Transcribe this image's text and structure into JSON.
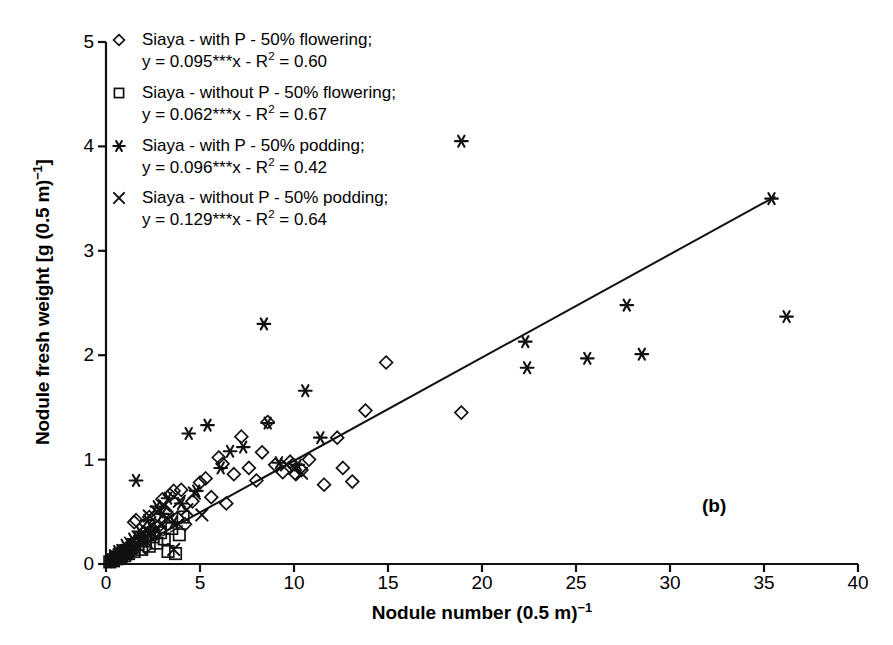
{
  "chart_data": {
    "type": "scatter",
    "title": "",
    "panel_label": "(b)",
    "xlabel": "Nodule number (0.5 m)⁻¹",
    "ylabel": "Nodule fresh weight [g (0.5 m)⁻¹]",
    "xlim": [
      0,
      40
    ],
    "ylim": [
      0,
      5
    ],
    "xticks": [
      0,
      5,
      10,
      15,
      20,
      25,
      30,
      35,
      40
    ],
    "yticks": [
      0,
      1,
      2,
      3,
      4,
      5
    ],
    "grid": false,
    "legend_position": "top-left",
    "series": [
      {
        "name": "Siaya - with P - 50% flowering;",
        "equation": "y = 0.095***x - R² = 0.60",
        "slope": 0.095,
        "r2": 0.6,
        "marker": "diamond",
        "color": "#000000",
        "trendline": "solid",
        "points": [
          [
            0.3,
            0.03
          ],
          [
            0.4,
            0.05
          ],
          [
            0.5,
            0.04
          ],
          [
            0.6,
            0.08
          ],
          [
            0.7,
            0.06
          ],
          [
            0.8,
            0.1
          ],
          [
            0.9,
            0.07
          ],
          [
            1.0,
            0.12
          ],
          [
            1.1,
            0.09
          ],
          [
            1.2,
            0.15
          ],
          [
            1.3,
            0.11
          ],
          [
            1.4,
            0.18
          ],
          [
            1.5,
            0.4
          ],
          [
            1.6,
            0.42
          ],
          [
            1.7,
            0.22
          ],
          [
            1.9,
            0.25
          ],
          [
            2.0,
            0.3
          ],
          [
            2.1,
            0.16
          ],
          [
            2.3,
            0.45
          ],
          [
            2.5,
            0.33
          ],
          [
            2.6,
            0.28
          ],
          [
            2.8,
            0.36
          ],
          [
            3.0,
            0.62
          ],
          [
            3.2,
            0.5
          ],
          [
            3.4,
            0.66
          ],
          [
            3.6,
            0.7
          ],
          [
            3.8,
            0.44
          ],
          [
            4.0,
            0.71
          ],
          [
            4.2,
            0.38
          ],
          [
            4.6,
            0.6
          ],
          [
            5.0,
            0.78
          ],
          [
            5.3,
            0.82
          ],
          [
            5.6,
            0.64
          ],
          [
            6.0,
            1.02
          ],
          [
            6.2,
            0.96
          ],
          [
            6.4,
            0.58
          ],
          [
            6.8,
            0.86
          ],
          [
            7.2,
            1.22
          ],
          [
            7.6,
            0.92
          ],
          [
            8.0,
            0.8
          ],
          [
            8.3,
            1.07
          ],
          [
            8.6,
            1.36
          ],
          [
            9.0,
            0.95
          ],
          [
            9.4,
            0.88
          ],
          [
            9.8,
            0.98
          ],
          [
            10.1,
            0.86
          ],
          [
            10.4,
            0.9
          ],
          [
            10.8,
            1.0
          ],
          [
            11.6,
            0.76
          ],
          [
            12.3,
            1.21
          ],
          [
            12.6,
            0.92
          ],
          [
            13.1,
            0.79
          ],
          [
            13.8,
            1.47
          ],
          [
            14.9,
            1.93
          ],
          [
            18.9,
            1.45
          ]
        ]
      },
      {
        "name": "Siaya - without P - 50% flowering;",
        "equation": "y = 0.062***x - R² = 0.67",
        "slope": 0.062,
        "r2": 0.67,
        "marker": "square",
        "color": "#000000",
        "trendline": "dashed",
        "points": [
          [
            0.2,
            0.02
          ],
          [
            0.3,
            0.04
          ],
          [
            0.4,
            0.03
          ],
          [
            0.5,
            0.06
          ],
          [
            0.6,
            0.05
          ],
          [
            0.7,
            0.09
          ],
          [
            0.8,
            0.07
          ],
          [
            0.9,
            0.11
          ],
          [
            1.0,
            0.08
          ],
          [
            1.1,
            0.13
          ],
          [
            1.2,
            0.1
          ],
          [
            1.4,
            0.16
          ],
          [
            1.5,
            0.12
          ],
          [
            1.7,
            0.19
          ],
          [
            1.9,
            0.14
          ],
          [
            2.1,
            0.22
          ],
          [
            2.3,
            0.17
          ],
          [
            2.5,
            0.26
          ],
          [
            2.7,
            0.2
          ],
          [
            2.9,
            0.3
          ],
          [
            3.1,
            0.24
          ],
          [
            3.3,
            0.12
          ],
          [
            3.5,
            0.34
          ],
          [
            3.7,
            0.1
          ],
          [
            3.9,
            0.28
          ],
          [
            4.1,
            0.45
          ]
        ]
      },
      {
        "name": "Siaya - with P - 50% podding;",
        "equation": "y = 0.096***x - R² = 0.42",
        "slope": 0.096,
        "r2": 0.42,
        "marker": "asterisk",
        "color": "#000000",
        "trendline": "none",
        "points": [
          [
            0.4,
            0.06
          ],
          [
            0.6,
            0.12
          ],
          [
            0.8,
            0.09
          ],
          [
            1.0,
            0.18
          ],
          [
            1.2,
            0.15
          ],
          [
            1.4,
            0.24
          ],
          [
            1.6,
            0.8
          ],
          [
            1.8,
            0.31
          ],
          [
            2.0,
            0.27
          ],
          [
            2.2,
            0.42
          ],
          [
            2.4,
            0.35
          ],
          [
            2.7,
            0.55
          ],
          [
            3.0,
            0.48
          ],
          [
            3.3,
            0.63
          ],
          [
            3.6,
            0.4
          ],
          [
            4.0,
            0.58
          ],
          [
            4.4,
            1.25
          ],
          [
            4.8,
            0.7
          ],
          [
            5.4,
            1.33
          ],
          [
            6.1,
            0.92
          ],
          [
            6.6,
            1.08
          ],
          [
            7.3,
            1.12
          ],
          [
            8.4,
            2.3
          ],
          [
            8.6,
            1.35
          ],
          [
            9.2,
            0.97
          ],
          [
            10.2,
            0.95
          ],
          [
            10.6,
            1.66
          ],
          [
            11.4,
            1.21
          ],
          [
            18.9,
            4.05
          ],
          [
            22.3,
            2.13
          ],
          [
            22.4,
            1.88
          ],
          [
            25.6,
            1.97
          ],
          [
            27.7,
            2.48
          ],
          [
            28.5,
            2.01
          ],
          [
            35.4,
            3.5
          ],
          [
            36.2,
            2.37
          ]
        ]
      },
      {
        "name": "Siaya - without P - 50% podding;",
        "equation": "y = 0.129***x - R² = 0.64",
        "slope": 0.129,
        "r2": 0.64,
        "marker": "cross",
        "color": "#000000",
        "trendline": "none",
        "points": [
          [
            0.3,
            0.04
          ],
          [
            0.5,
            0.08
          ],
          [
            0.7,
            0.06
          ],
          [
            0.9,
            0.13
          ],
          [
            1.1,
            0.1
          ],
          [
            1.3,
            0.2
          ],
          [
            1.5,
            0.17
          ],
          [
            1.7,
            0.26
          ],
          [
            1.9,
            0.22
          ],
          [
            2.1,
            0.33
          ],
          [
            2.3,
            0.46
          ],
          [
            2.5,
            0.29
          ],
          [
            2.7,
            0.5
          ],
          [
            2.9,
            0.38
          ],
          [
            3.1,
            0.56
          ],
          [
            3.3,
            0.43
          ],
          [
            3.6,
            0.14
          ],
          [
            3.9,
            0.6
          ],
          [
            4.3,
            0.52
          ],
          [
            4.7,
            0.68
          ],
          [
            5.1,
            0.47
          ],
          [
            9.6,
            0.95
          ],
          [
            10.0,
            0.92
          ],
          [
            10.4,
            0.87
          ]
        ]
      }
    ],
    "regression_line": {
      "label": "overall-fit-line",
      "x_start": 0.0,
      "y_start": 0.0,
      "x_end": 35.6,
      "y_end": 3.52,
      "style": "solid"
    }
  }
}
